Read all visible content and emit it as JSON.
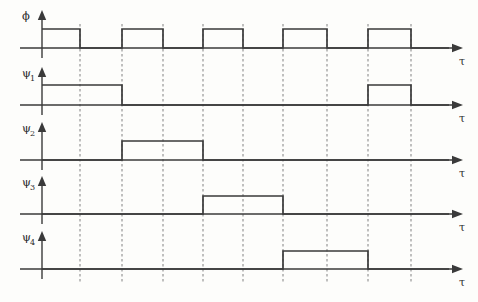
{
  "figure": {
    "type": "timing-diagram",
    "title": "",
    "background_color": "#fdfdfb",
    "line_color": "#3a3a3a",
    "gridline_color": "#8d8d8d",
    "axis_label_x": "τ",
    "rows": [
      {
        "id": "phi",
        "label": "ϕ",
        "subscript": "",
        "axis_label": "τ",
        "baseline_y": 48,
        "high_y": 29,
        "pulses": [
          {
            "start": 42,
            "end": 80
          },
          {
            "start": 122,
            "end": 163
          },
          {
            "start": 203,
            "end": 243
          },
          {
            "start": 283,
            "end": 327
          },
          {
            "start": 368,
            "end": 411
          }
        ]
      },
      {
        "id": "psi1",
        "label": "ψ",
        "subscript": "1",
        "axis_label": "τ",
        "baseline_y": 105,
        "high_y": 85,
        "pulses": [
          {
            "start": 42,
            "end": 122
          },
          {
            "start": 368,
            "end": 411
          }
        ]
      },
      {
        "id": "psi2",
        "label": "ψ",
        "subscript": "2",
        "axis_label": "τ",
        "baseline_y": 160,
        "high_y": 141,
        "pulses": [
          {
            "start": 122,
            "end": 203
          }
        ]
      },
      {
        "id": "psi3",
        "label": "ψ",
        "subscript": "3",
        "axis_label": "τ",
        "baseline_y": 214,
        "high_y": 196,
        "pulses": [
          {
            "start": 203,
            "end": 283
          }
        ]
      },
      {
        "id": "psi4",
        "label": "ψ",
        "subscript": "4",
        "axis_label": "τ",
        "baseline_y": 269,
        "high_y": 251,
        "pulses": [
          {
            "start": 283,
            "end": 368
          }
        ]
      }
    ],
    "gridlines": [
      80,
      122,
      163,
      203,
      243,
      283,
      327,
      368,
      411
    ],
    "grid_top": 24,
    "grid_bottom": 283,
    "vertical_axis_x": 42,
    "axis_right_end": 452
  },
  "chart_data": {
    "type": "line",
    "xlabel": "τ",
    "ylabel": "",
    "x": [
      0,
      1,
      2,
      3,
      4,
      5,
      6,
      7,
      8,
      9
    ],
    "xlim": [
      0,
      10
    ],
    "ylim": [
      0,
      1
    ],
    "grid": true,
    "legend_position": "left-labels",
    "series": [
      {
        "name": "ϕ",
        "values": [
          1,
          0,
          1,
          0,
          1,
          0,
          1,
          0,
          1,
          0
        ]
      },
      {
        "name": "ψ₁",
        "values": [
          1,
          1,
          0,
          0,
          0,
          0,
          0,
          0,
          1,
          0
        ]
      },
      {
        "name": "ψ₂",
        "values": [
          0,
          0,
          1,
          1,
          0,
          0,
          0,
          0,
          0,
          0
        ]
      },
      {
        "name": "ψ₃",
        "values": [
          0,
          0,
          0,
          0,
          1,
          1,
          0,
          0,
          0,
          0
        ]
      },
      {
        "name": "ψ₄",
        "values": [
          0,
          0,
          0,
          0,
          0,
          0,
          1,
          1,
          0,
          0
        ]
      }
    ],
    "annotations": [
      "Four-phase non-overlapping clock generated from master clock ϕ"
    ]
  }
}
